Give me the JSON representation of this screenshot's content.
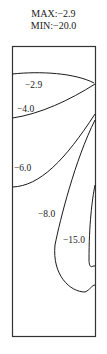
{
  "header": {
    "max_label": "MAX:−2.9",
    "min_label": "MIN:−20.0"
  },
  "contours": [
    {
      "label": "−2.9",
      "value": -2.9
    },
    {
      "label": "−4.0",
      "value": -4.0
    },
    {
      "label": "−6.0",
      "value": -6.0
    },
    {
      "label": "−8.0",
      "value": -8.0
    },
    {
      "label": "−15.0",
      "value": -15.0
    }
  ],
  "colors": {
    "line": "#1a1a1a",
    "background": "#ffffff"
  }
}
